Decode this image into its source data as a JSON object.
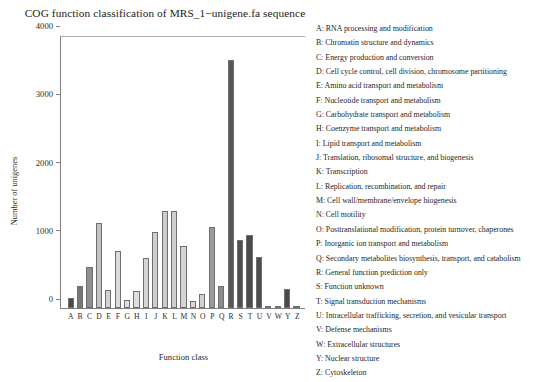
{
  "chart_data": {
    "type": "bar",
    "title": "COG function classification of MRS_1−unigene.fa sequence",
    "xlabel": "Function class",
    "ylabel": "Number of unigenes",
    "ylim": [
      0,
      4000
    ],
    "yticks": [
      0,
      1000,
      2000,
      3000,
      4000
    ],
    "ytick_labels": [
      "0",
      "1000",
      "2000",
      "3000",
      "4000"
    ],
    "grid": false,
    "legend_position": "right",
    "categories": [
      "A",
      "B",
      "C",
      "D",
      "E",
      "F",
      "G",
      "H",
      "I",
      "J",
      "K",
      "L",
      "M",
      "N",
      "O",
      "P",
      "Q",
      "R",
      "S",
      "T",
      "U",
      "V",
      "W",
      "Y",
      "Z"
    ],
    "values": [
      150,
      330,
      600,
      1250,
      260,
      840,
      120,
      250,
      740,
      1120,
      1430,
      1420,
      910,
      105,
      210,
      1190,
      330,
      3650,
      1000,
      1080,
      750,
      30,
      15,
      280,
      20
    ],
    "bar_colors": [
      "#4a4a4a",
      "#777777",
      "#8f8f8f",
      "#c2c2c2",
      "#d2d2d2",
      "#dcdcdc",
      "#e0e0e0",
      "#dedede",
      "#d6d6d6",
      "#cfcfcf",
      "#cccccc",
      "#cecece",
      "#d4d4d4",
      "#d8d8d8",
      "#d2d2d2",
      "#9a9a9a",
      "#8c8c8c",
      "#565656",
      "#4f4f4f",
      "#4b4b4b",
      "#4d4d4d",
      "#4a4a4a",
      "#4a4a4a",
      "#4a4a4a",
      "#4a4a4a"
    ],
    "legend": [
      "A: RNA processing and modification",
      "B: Chromatin structure and dynamics",
      "C: Energy production and conversion",
      "D: Cell cycle control, cell division, chromosome partitioning",
      "E: Amino acid transport and metabolism",
      "F: Nucleotide transport and metabolism",
      "G: Carbohydrate transport and metabolism",
      "H: Coenzyme transport and metabolism",
      "I: Lipid transport and metabolism",
      "J: Translation, ribosomal structure, and biogenesis",
      "K: Transcription",
      "L: Replication, recombination, and repair",
      "M: Cell wall/membrane/envelope biogenesis",
      "N: Cell motility",
      "O: Posttranslational modification, protein turnover, chaperones",
      "P: Inorganic ion transport and metabolism",
      "Q: Secondary metabolites biosynthesis, transport, and catabolism",
      "R: General function prediction only",
      "S: Function unknown",
      "T: Signal transduction mechanisms",
      "U: Intracellular trafficking, secretion, and vesicular transport",
      "V: Defense mechanisms",
      "W: Extracellular structures",
      "Y: Nuclear structure",
      "Z: Cytoskeleton"
    ]
  }
}
